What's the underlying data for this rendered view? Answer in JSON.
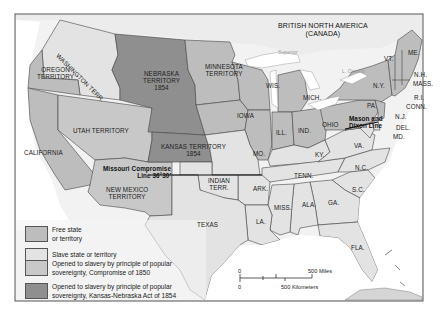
{
  "map": {
    "title_region": "BRITISH NORTH AMERICA",
    "title_region_sub": "(CANADA)",
    "colors": {
      "free": "#bdbdbd",
      "slave": "#e3e3e3",
      "compromise_1850": "#c8c8c8",
      "kansas_nebraska": "#8f8f8f",
      "water": "#ffffff",
      "border": "#444444",
      "frame": "#555555"
    },
    "lake_labels": {
      "superior": "Superior",
      "ontario": "L. Ontario"
    },
    "territories": {
      "washington": "WASHINGTON TERR.",
      "oregon": [
        "OREGON",
        "TERRITORY"
      ],
      "nebraska": [
        "NEBRASKA",
        "TERRITORY",
        "1854"
      ],
      "minnesota": [
        "MINNESOTA",
        "TERRITORY"
      ],
      "utah": "UTAH TERRITORY",
      "kansas": [
        "KANSAS TERRITORY",
        "1854"
      ],
      "new_mexico": [
        "NEW MEXICO",
        "TERRITORY"
      ],
      "indian": [
        "INDIAN",
        "TERR."
      ]
    },
    "states": {
      "california": "CALIFORNIA",
      "texas": "TEXAS",
      "iowa": "IOWA",
      "wis": "WIS.",
      "mich": "MICH.",
      "ill": "ILL.",
      "ind": "IND.",
      "ohio": "OHIO",
      "mo": "MO.",
      "ky": "KY.",
      "ark": "ARK.",
      "la": "LA.",
      "tenn": "TENN.",
      "miss": "MISS.",
      "ala": "ALA.",
      "ga": "GA.",
      "sc": "S.C.",
      "nc": "N.C.",
      "va": "VA.",
      "pa": "PA.",
      "ny": "N.Y.",
      "vt": "VT.",
      "me": "ME.",
      "nh": "N.H.",
      "mass": "MASS.",
      "ri": "R.I.",
      "conn": "CONN.",
      "nj": "N.J.",
      "del": "DEL.",
      "md": "MD.",
      "fla": "FLA."
    },
    "lines": {
      "missouri_compromise": [
        "Missouri Compromise",
        "Line 36°30′"
      ],
      "mason_dixon": [
        "Mason and",
        "Dixon Line"
      ]
    },
    "scale": {
      "zero_top": "0",
      "miles": "500 Miles",
      "zero_bottom": "0",
      "km": "500 Kilometers"
    }
  },
  "legend": {
    "items": [
      {
        "key": "free",
        "label_lines": [
          "Free state",
          "or territory"
        ]
      },
      {
        "key": "slave",
        "label_lines": [
          "Slave state or territory"
        ]
      },
      {
        "key": "compromise_1850",
        "label_lines": [
          "Opened to slavery by principle of popular",
          "sovereignty, Compromise of 1850"
        ]
      },
      {
        "key": "kansas_nebraska",
        "label_lines": [
          "Opened to slavery by principle of popular",
          "sovereignty, Kansas-Nebraska Act of 1854"
        ]
      }
    ]
  }
}
